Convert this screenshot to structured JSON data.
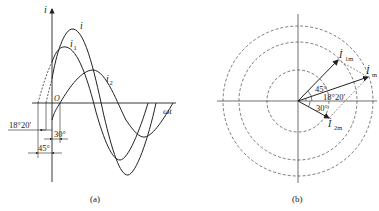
{
  "panel_a": {
    "caption": "(a)",
    "y_axis_label": "i",
    "x_axis_label": "ωt",
    "origin_label": "O",
    "curves": [
      {
        "name": "i",
        "label": "i",
        "sub": ""
      },
      {
        "name": "i1",
        "label": "i",
        "sub": "1"
      },
      {
        "name": "i2",
        "label": "i",
        "sub": "2"
      }
    ],
    "angles": {
      "a1": "18°20′",
      "a2": "30°",
      "a3": "45°"
    }
  },
  "panel_b": {
    "caption": "(b)",
    "phasors": [
      {
        "name": "I1m",
        "label": "İ",
        "sub": "1m",
        "angle_deg": 45
      },
      {
        "name": "Im",
        "label": "İ",
        "sub": "m",
        "angle_deg": 18.33
      },
      {
        "name": "I2m",
        "label": "İ",
        "sub": "2m",
        "angle_deg": -30
      }
    ],
    "angle_labels": {
      "a45": "45°",
      "a1820": "18°20′",
      "a30": "30°"
    }
  },
  "colors": {
    "line": "#222222",
    "dash": "#444444"
  }
}
